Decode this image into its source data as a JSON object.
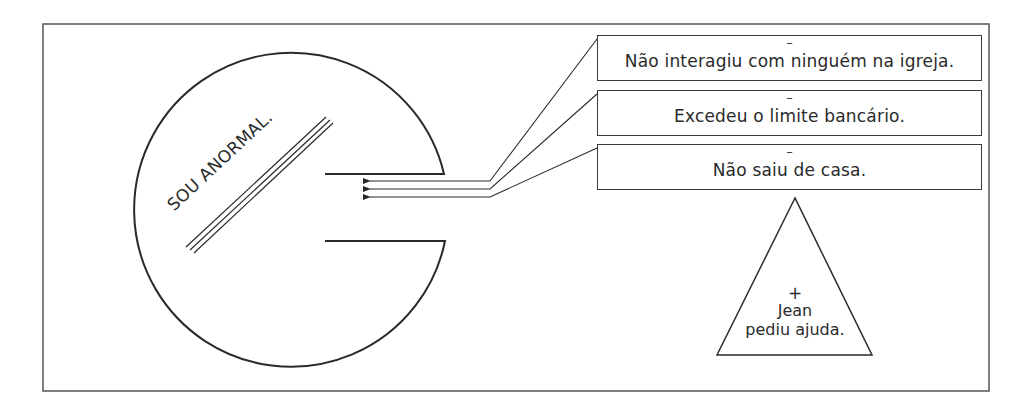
{
  "diagram": {
    "type": "cognitive-schema-illustration",
    "core_belief": "SOU ANORMAL.",
    "negative_evidence": [
      {
        "sign": "–",
        "text": "Não interagiu com ninguém na igreja."
      },
      {
        "sign": "–",
        "text": "Excedeu o limite bancário."
      },
      {
        "sign": "–",
        "text": "Não saiu de casa."
      }
    ],
    "positive_evidence": {
      "sign": "+",
      "line1": "Jean",
      "line2": "pediu ajuda."
    },
    "colors": {
      "stroke": "#2a2a2a",
      "frame": "#555555",
      "background": "#ffffff"
    }
  }
}
